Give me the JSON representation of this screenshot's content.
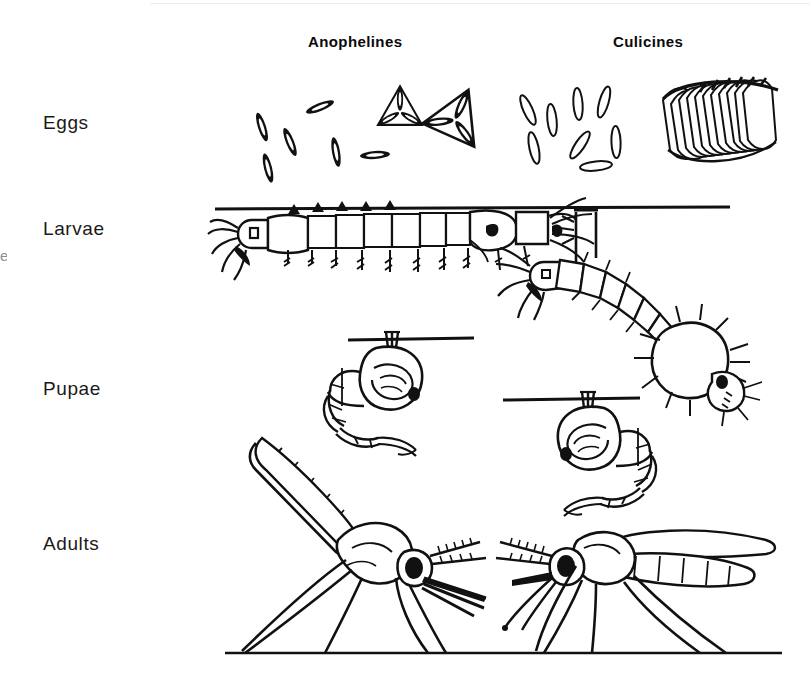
{
  "figure": {
    "background_color": "#ffffff",
    "ink_color": "#000000",
    "width": 811,
    "height": 679
  },
  "columns": [
    {
      "id": "anophelines",
      "label": "Anophelines"
    },
    {
      "id": "culicines",
      "label": "Culicines"
    }
  ],
  "rows": [
    {
      "id": "eggs",
      "label": "Eggs"
    },
    {
      "id": "larvae",
      "label": "Larvae"
    },
    {
      "id": "pupae",
      "label": "Pupae"
    },
    {
      "id": "adults",
      "label": "Adults"
    }
  ],
  "artifacts": {
    "left_edge_fragment": "e"
  },
  "cells": {
    "eggs_anophelines": {
      "description": "Scattered solid boat-shaped eggs laid singly, plus two radial star-shaped egg clusters",
      "egg_count_single": 6,
      "cluster_count": 2,
      "egg_style": "filled-spindle"
    },
    "eggs_culicines": {
      "description": "Scattered outlined elongated eggs laid singly, plus a raft of many eggs standing on end",
      "egg_count_single": 8,
      "raft_egg_count": 14,
      "egg_style": "outlined-spindle"
    },
    "larvae_anophelines": {
      "description": "Larva resting horizontally, parallel to and flush against the water surface; no siphon",
      "posture": "parallel-to-surface",
      "segments": 9,
      "siphon": "absent"
    },
    "larvae_culicines": {
      "description": "Larva hanging head-down at an angle, suspended from the water surface by a long air siphon",
      "posture": "angled-head-down",
      "segments": 9,
      "siphon": "present"
    },
    "pupae_anophelines": {
      "description": "Comma-shaped pupa hanging just beneath the water surface, short breathing trumpets",
      "orientation": "head-right",
      "trumpets": "short"
    },
    "pupae_culicines": {
      "description": "Comma-shaped pupa hanging just beneath the water surface, longer breathing trumpets",
      "orientation": "head-left",
      "trumpets": "long"
    },
    "adults_anophelines": {
      "description": "Adult at rest with body held at a steep angle to the surface, in line with the proboscis; palps long",
      "resting_angle": "steep / in line with proboscis",
      "palps": "long"
    },
    "adults_culicines": {
      "description": "Adult at rest with body roughly parallel to the surface and hunched, proboscis bent down; palps short",
      "resting_angle": "parallel to surface, hunched",
      "palps": "short"
    }
  },
  "surface_lines": [
    {
      "for": "larvae",
      "role": "water-surface"
    },
    {
      "for": "pupae-anophelines",
      "role": "water-surface"
    },
    {
      "for": "pupae-culicines",
      "role": "water-surface"
    },
    {
      "for": "adults",
      "role": "ground-surface"
    }
  ]
}
